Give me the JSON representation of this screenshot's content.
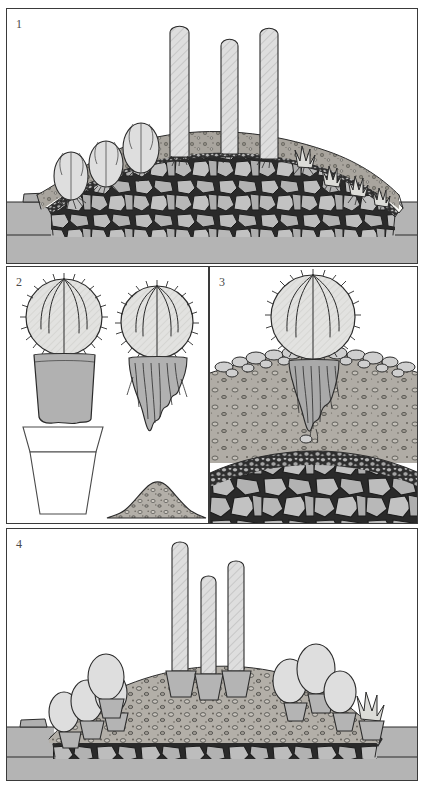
{
  "document": {
    "title": "Raised rock-garden bed construction sequence",
    "panel_count": 4,
    "ink_color": "#2b2b2b",
    "paper_color": "#ffffff"
  },
  "palette": {
    "ground_gray": "#b4b4b4",
    "gritty_topdressing": "#a8a49d",
    "rubble_stone": "#b9b9b9",
    "pebble_layer": "#9d9d9d",
    "cactus_body": "#dcdcd8",
    "rootball_soil": "#b2b2b2",
    "membrane_white": "#fbfbf7",
    "outline": "#2b2b2b"
  },
  "panels": [
    {
      "id": "panel-1",
      "number": "1",
      "caption_text": "",
      "subject": "finished raised bed in cross-section with planted cacti and agaves",
      "layers": [
        {
          "name": "surrounding ground level",
          "fill": "ground_gray"
        },
        {
          "name": "rubble / broken stone core",
          "fill": "rubble_stone"
        },
        {
          "name": "pebble drainage course",
          "fill": "pebble_layer"
        },
        {
          "name": "white membrane separating layer",
          "fill": "membrane_white"
        },
        {
          "name": "gritty planting mix cap",
          "fill": "gritty_topdressing"
        }
      ],
      "plants": [
        {
          "type": "columnar-cactus",
          "count": 3,
          "note": "tall hatched columns at crown"
        },
        {
          "type": "globular-cactus",
          "count": 3,
          "note": "rounded barrel cacti on left flank"
        },
        {
          "type": "agave-rosette",
          "count": 4,
          "note": "spiky rosettes on right flank"
        }
      ]
    },
    {
      "id": "panel-2",
      "number": "2",
      "caption_text": "",
      "subject": "preparing a plant: cactus with pot-shaped rootball, teased-out roots, empty pot and soil mound",
      "items": [
        {
          "name": "cactus-with-intact-rootball",
          "note": "ribbed globular cactus above a block of compost"
        },
        {
          "name": "cactus-with-teased-roots",
          "note": "same cactus with roots loosened and hanging"
        },
        {
          "name": "empty-plant-pot",
          "note": "tapered pot with rim, drawn in outline"
        },
        {
          "name": "discarded-soil-mound",
          "note": "small heap of gritty compost"
        }
      ]
    },
    {
      "id": "panel-3",
      "number": "3",
      "caption_text": "",
      "subject": "detail of one cactus planted directly into the bed, roots spread in the gritty mix",
      "layers": [
        {
          "name": "stone top-dressing collar",
          "fill": "rubble_stone"
        },
        {
          "name": "gritty planting mix",
          "fill": "gritty_topdressing"
        },
        {
          "name": "pebble drainage course",
          "fill": "pebble_layer"
        },
        {
          "name": "rubble / broken stone core",
          "fill": "rubble_stone"
        }
      ],
      "plants": [
        {
          "type": "globular-cactus",
          "count": 1,
          "note": "large ribbed cactus with fibrous roots"
        }
      ]
    },
    {
      "id": "panel-4",
      "number": "4",
      "caption_text": "",
      "subject": "alternative method: plants left in their pots and plunged into the gritty bed",
      "layers": [
        {
          "name": "surrounding ground level",
          "fill": "ground_gray"
        },
        {
          "name": "rubble / broken stone core",
          "fill": "rubble_stone"
        },
        {
          "name": "pebble drainage course",
          "fill": "pebble_layer"
        },
        {
          "name": "gritty plunge medium",
          "fill": "gritty_topdressing"
        }
      ],
      "plants": [
        {
          "type": "columnar-cactus-in-pot",
          "count": 3,
          "note": "tall hatched columns, each in a sunken pot"
        },
        {
          "type": "globular-cactus-in-pot",
          "count": 7,
          "note": "rounded cacti in sunken pots along both flanks"
        },
        {
          "type": "agave-rosette-in-pot",
          "count": 1,
          "note": "spiky rosette in a sunken pot at far right"
        }
      ]
    }
  ]
}
